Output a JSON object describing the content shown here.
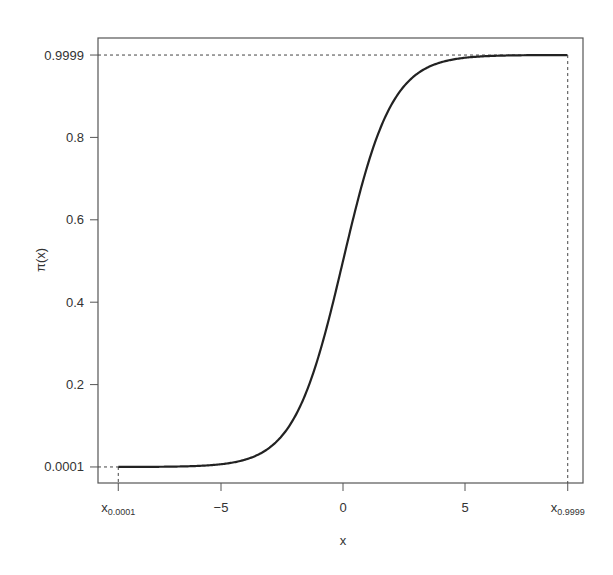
{
  "chart_data": {
    "type": "line",
    "title": "",
    "xlabel": "x",
    "ylabel": "π(x)",
    "function": "logistic: π(x) = 1/(1+exp(-x))",
    "xlim": [
      -9.9,
      9.9
    ],
    "ylim": [
      -0.03,
      1.03
    ],
    "x_ticks": [
      {
        "value": -9.21,
        "label": "x",
        "sub": "0.0001"
      },
      {
        "value": -5,
        "label": "−5"
      },
      {
        "value": 0,
        "label": "0"
      },
      {
        "value": 5,
        "label": "5"
      },
      {
        "value": 9.21,
        "label": "x",
        "sub": "0.9999"
      }
    ],
    "y_ticks": [
      {
        "value": 0.0001,
        "label": "0.0001"
      },
      {
        "value": 0.2,
        "label": "0.2"
      },
      {
        "value": 0.4,
        "label": "0.4"
      },
      {
        "value": 0.6,
        "label": "0.6"
      },
      {
        "value": 0.8,
        "label": "0.8"
      },
      {
        "value": 0.9999,
        "label": "0.9999"
      }
    ],
    "series": [
      {
        "name": "π(x)",
        "x": [
          -9.21,
          -8,
          -7,
          -6,
          -5,
          -4,
          -3,
          -2,
          -1,
          0,
          1,
          2,
          3,
          4,
          5,
          6,
          7,
          8,
          9.21
        ],
        "values": [
          0.0001,
          0.0003,
          0.0009,
          0.0025,
          0.0067,
          0.018,
          0.047,
          0.119,
          0.269,
          0.5,
          0.731,
          0.881,
          0.953,
          0.982,
          0.993,
          0.9975,
          0.9991,
          0.9997,
          0.9999
        ]
      }
    ],
    "reference_lines": [
      {
        "type": "dashed",
        "from": [
          -9.21,
          0.0001
        ],
        "note": "guides to x0.0001 and 0.0001"
      },
      {
        "type": "dashed",
        "from": [
          9.21,
          0.9999
        ],
        "note": "guides to x0.9999 and 0.9999"
      }
    ],
    "grid": false,
    "legend": null
  },
  "labels": {
    "xlabel": "x",
    "ylabel": "π(x)"
  }
}
